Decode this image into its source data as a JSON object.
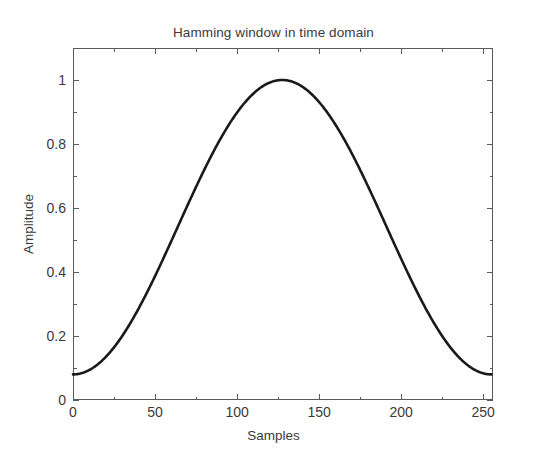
{
  "chart_data": {
    "type": "line",
    "title": "Hamming window in time domain",
    "xlabel": "Samples",
    "ylabel": "Amplitude",
    "xlim": [
      0,
      256
    ],
    "ylim": [
      0,
      1.1
    ],
    "grid": false,
    "legend": null,
    "xticks": [
      0,
      50,
      100,
      150,
      200,
      250
    ],
    "xticklabels": [
      "0",
      "50",
      "100",
      "150",
      "200",
      "250"
    ],
    "yticks": [
      0,
      0.2,
      0.4,
      0.6,
      0.8,
      1
    ],
    "yticklabels": [
      "0",
      "0.2",
      "0.4",
      "0.6",
      "0.8",
      "1"
    ],
    "xminorticks": [
      25,
      75,
      125,
      175,
      225
    ],
    "yminorticks": [
      0.1,
      0.3,
      0.5,
      0.7,
      0.9,
      1.1
    ],
    "line_color": "#1a1a1a",
    "line_width": 2.6,
    "series": [
      {
        "name": "Hamming window (N=256)",
        "formula": "w(n) = 0.54 - 0.46*cos(2*pi*n/255)",
        "x": [
          0,
          8,
          16,
          24,
          32,
          40,
          48,
          56,
          64,
          72,
          80,
          88,
          96,
          104,
          112,
          120,
          127.5,
          135,
          143,
          151,
          159,
          167,
          175,
          183,
          191,
          199,
          207,
          215,
          223,
          231,
          239,
          247,
          255
        ],
        "y": [
          0.08,
          0.0844,
          0.0976,
          0.1192,
          0.1487,
          0.1853,
          0.2283,
          0.2766,
          0.329,
          0.3843,
          0.4412,
          0.4985,
          0.5548,
          0.6088,
          0.6594,
          0.7053,
          0.7423,
          0.7723,
          0.8037,
          0.8299,
          0.8503,
          0.8644,
          0.872,
          0.873,
          0.8673,
          0.8551,
          0.8367,
          0.8125,
          0.783,
          0.7488,
          0.7105,
          0.669,
          0.625
        ],
        "peak_value": 1.0,
        "peak_x": 127.5,
        "endpoint_value": 0.08
      }
    ]
  }
}
